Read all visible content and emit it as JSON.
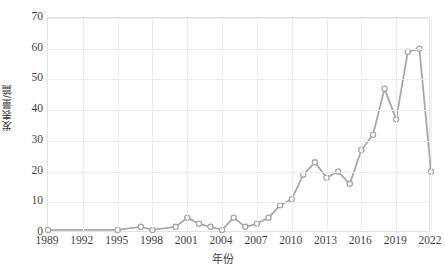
{
  "chart_data": {
    "type": "line",
    "title": "",
    "xlabel": "年份",
    "ylabel": "发表量/篇",
    "xlim": [
      1989,
      2022
    ],
    "ylim": [
      0,
      70
    ],
    "ytick_step": 10,
    "xtick_step": 3,
    "grid": true,
    "legend": null,
    "marker": "open-circle",
    "series_color": "#a8a8a8",
    "grid_color": "#ededed",
    "axis_color": "#e2e2e2",
    "text_color": "#3f3f3f",
    "xticks": [
      "1989",
      "1992",
      "1995",
      "1998",
      "2001",
      "2004",
      "2007",
      "2010",
      "2013",
      "2016",
      "2019",
      "2022"
    ],
    "yticks": [
      "0",
      "10",
      "20",
      "30",
      "40",
      "50",
      "60",
      "70"
    ],
    "x": [
      1989,
      1995,
      1997,
      1998,
      2000,
      2001,
      2002,
      2003,
      2004,
      2005,
      2006,
      2007,
      2008,
      2009,
      2010,
      2011,
      2012,
      2013,
      2014,
      2015,
      2016,
      2017,
      2018,
      2019,
      2020,
      2021,
      2022
    ],
    "values": [
      1,
      1,
      2,
      1,
      2,
      5,
      3,
      2,
      1,
      5,
      2,
      3,
      5,
      9,
      11,
      19,
      23,
      18,
      20,
      16,
      27,
      32,
      47,
      37,
      59,
      60,
      20
    ],
    "points": [
      {
        "year": 1989,
        "value": 1
      },
      {
        "year": 1995,
        "value": 1
      },
      {
        "year": 1997,
        "value": 2
      },
      {
        "year": 1998,
        "value": 1
      },
      {
        "year": 2000,
        "value": 2
      },
      {
        "year": 2001,
        "value": 5
      },
      {
        "year": 2002,
        "value": 3
      },
      {
        "year": 2003,
        "value": 2
      },
      {
        "year": 2004,
        "value": 1
      },
      {
        "year": 2005,
        "value": 5
      },
      {
        "year": 2006,
        "value": 2
      },
      {
        "year": 2007,
        "value": 3
      },
      {
        "year": 2008,
        "value": 5
      },
      {
        "year": 2009,
        "value": 9
      },
      {
        "year": 2010,
        "value": 11
      },
      {
        "year": 2011,
        "value": 19
      },
      {
        "year": 2012,
        "value": 23
      },
      {
        "year": 2013,
        "value": 18
      },
      {
        "year": 2014,
        "value": 20
      },
      {
        "year": 2015,
        "value": 16
      },
      {
        "year": 2016,
        "value": 27
      },
      {
        "year": 2017,
        "value": 32
      },
      {
        "year": 2018,
        "value": 47
      },
      {
        "year": 2019,
        "value": 37
      },
      {
        "year": 2020,
        "value": 59
      },
      {
        "year": 2021,
        "value": 60
      },
      {
        "year": 2022,
        "value": 20
      }
    ]
  }
}
